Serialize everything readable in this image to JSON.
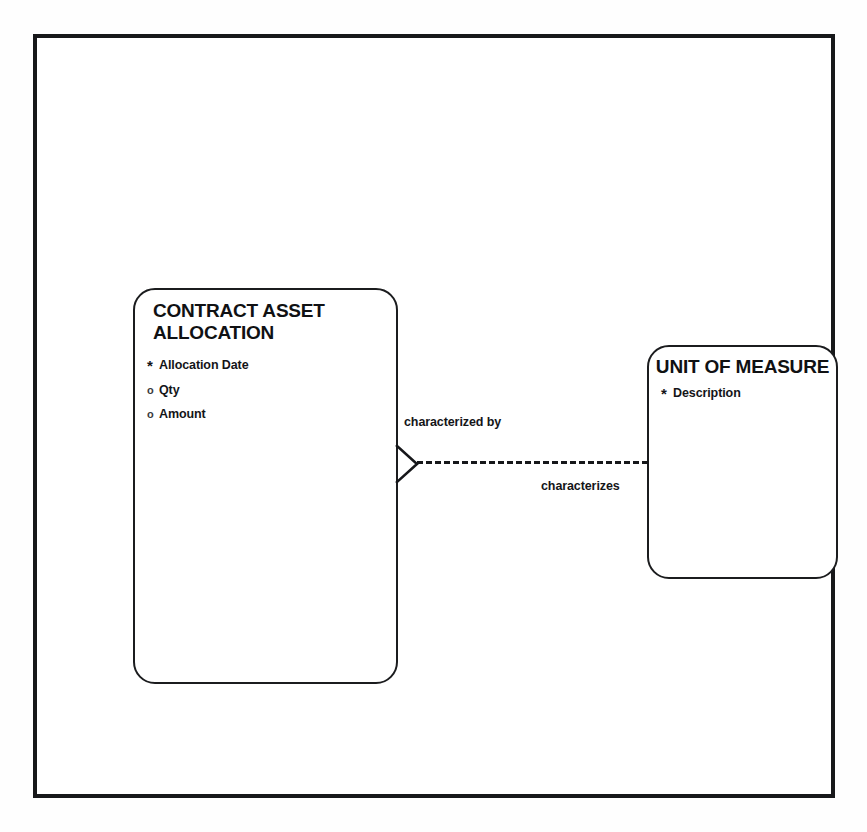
{
  "diagram": {
    "type": "entity-relationship-diagram",
    "notation": "Barker / Oracle ER",
    "entities": [
      {
        "id": "contract-asset-allocation",
        "name": "CONTRACT ASSET\nALLOCATION",
        "attributes": [
          {
            "marker": "*",
            "marker_type": "mandatory",
            "name": "Allocation Date"
          },
          {
            "marker": "o",
            "marker_type": "optional",
            "name": "Qty"
          },
          {
            "marker": "o",
            "marker_type": "optional",
            "name": "Amount"
          }
        ]
      },
      {
        "id": "unit-of-measure",
        "name": "UNIT OF MEASURE",
        "attributes": [
          {
            "marker": "*",
            "marker_type": "mandatory",
            "name": "Description"
          }
        ]
      }
    ],
    "relationship": {
      "forward_label": "characterized by",
      "inverse_label": "characterizes",
      "line_style": "dashed",
      "source_end": "crows-foot",
      "target_end": "plain",
      "source": "CONTRACT ASSET ALLOCATION",
      "target": "UNIT OF MEASURE"
    },
    "colors": {
      "ink": "#16171a",
      "frame": "#17181a",
      "paper": "#ffffff"
    }
  }
}
